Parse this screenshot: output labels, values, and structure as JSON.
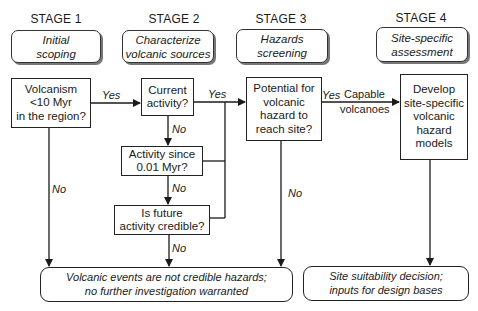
{
  "stages": [
    {
      "label": "STAGE 1",
      "title_line1": "Initial",
      "title_line2": "scoping"
    },
    {
      "label": "STAGE 2",
      "title_line1": "Characterize",
      "title_line2": "volcanic sources"
    },
    {
      "label": "STAGE 3",
      "title_line1": "Hazards",
      "title_line2": "screening"
    },
    {
      "label": "STAGE 4",
      "title_line1": "Site-specific",
      "title_line2": "assessment"
    }
  ],
  "nodes": {
    "volcanism": {
      "lines": [
        "Volcanism",
        "<10 Myr",
        "in the region?"
      ]
    },
    "current_activity": {
      "lines": [
        "Current",
        "activity?"
      ]
    },
    "activity_since": {
      "lines": [
        "Activity since",
        "0.01 Myr?"
      ]
    },
    "future_activity": {
      "lines": [
        "Is future",
        "activity credible?"
      ]
    },
    "potential_hazard": {
      "lines": [
        "Potential for",
        "volcanic",
        "hazard to",
        "reach site?"
      ]
    },
    "develop_models": {
      "lines": [
        "Develop",
        "site-specific",
        "volcanic",
        "hazard",
        "models"
      ]
    }
  },
  "terminals": {
    "not_credible": {
      "lines": [
        "Volcanic events are not credible hazards;",
        "no further investigation warranted"
      ]
    },
    "site_decision": {
      "lines": [
        "Site suitability decision;",
        "inputs for design bases"
      ]
    }
  },
  "edge_labels": {
    "volcanism_yes": "Yes",
    "volcanism_no": "No",
    "current_yes": "Yes",
    "current_no": "No",
    "since_no": "No",
    "future_no": "No",
    "potential_yes": "Yes",
    "potential_capable_line1": "Capable",
    "potential_capable_line2": "volcanoes",
    "potential_no": "No"
  },
  "colors": {
    "line": "#1a1a1a",
    "shadow": "#777777",
    "background": "#ffffff"
  }
}
